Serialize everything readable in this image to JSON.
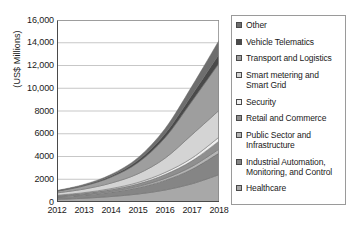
{
  "chart_data": {
    "type": "area",
    "stacked": true,
    "title": "",
    "xlabel": "",
    "ylabel": "(US$ Millions)",
    "x": [
      2012,
      2013,
      2014,
      2015,
      2016,
      2017,
      2018
    ],
    "xtick_labels": [
      "2012",
      "2013",
      "2014",
      "2015",
      "2016",
      "2017",
      "2018"
    ],
    "ytick_labels": [
      "16,000",
      "14,000",
      "12,000",
      "10,000",
      "8000",
      "6000",
      "4000",
      "2000",
      "0"
    ],
    "ytick_values": [
      16000,
      14000,
      12000,
      10000,
      8000,
      6000,
      4000,
      2000,
      0
    ],
    "ylim": [
      0,
      16000
    ],
    "grid": "horizontal",
    "legend_position": "right",
    "stack_order_bottom_to_top": [
      "Healthcare",
      "Industrial Automation, Monitoring, and Control",
      "Public Sector and Infrastructure",
      "Retail and Commerce",
      "Security",
      "Smart metering and Smart Grid",
      "Transport and Logistics",
      "Vehicle Telematics",
      "Other"
    ],
    "series": [
      {
        "name": "Healthcare",
        "color": "#a8a8a8",
        "values": [
          230,
          330,
          480,
          700,
          1050,
          1600,
          2400
        ]
      },
      {
        "name": "Industrial Automation, Monitoring, and Control",
        "color": "#858585",
        "values": [
          200,
          270,
          380,
          560,
          850,
          1280,
          1900
        ]
      },
      {
        "name": "Public Sector and Infrastructure",
        "color": "#b5b5b5",
        "values": [
          40,
          55,
          80,
          115,
          175,
          250,
          350
        ]
      },
      {
        "name": "Retail and Commerce",
        "color": "#8f8f8f",
        "values": [
          80,
          110,
          155,
          225,
          340,
          490,
          700
        ]
      },
      {
        "name": "Security",
        "color": "#efefef",
        "values": [
          45,
          60,
          85,
          120,
          180,
          250,
          350
        ]
      },
      {
        "name": "Smart metering and Smart Grid",
        "color": "#d4d4d4",
        "values": [
          200,
          310,
          480,
          760,
          1250,
          2050,
          2350
        ]
      },
      {
        "name": "Transport and Logistics",
        "color": "#9e9e9e",
        "values": [
          150,
          280,
          520,
          980,
          1800,
          2950,
          4150
        ]
      },
      {
        "name": "Vehicle Telematics",
        "color": "#4a4a4a",
        "values": [
          30,
          60,
          110,
          200,
          360,
          560,
          800
        ]
      },
      {
        "name": "Other",
        "color": "#6e6e6e",
        "values": [
          35,
          70,
          130,
          240,
          440,
          760,
          1200
        ]
      }
    ],
    "totals": [
      1010,
      1545,
      2420,
      3900,
      6445,
      10190,
      14200
    ]
  },
  "legend": {
    "items": [
      {
        "label": "Other",
        "color": "#6e6e6e"
      },
      {
        "label": "Vehicle Telematics",
        "color": "#4a4a4a"
      },
      {
        "label": "Transport and Logistics",
        "color": "#9e9e9e"
      },
      {
        "label": "Smart metering and Smart Grid",
        "color": "#d4d4d4"
      },
      {
        "label": "Security",
        "color": "#efefef"
      },
      {
        "label": "Retail and Commerce",
        "color": "#8f8f8f"
      },
      {
        "label": "Public Sector and Infrastructure",
        "color": "#b5b5b5"
      },
      {
        "label": "Industrial Automation, Monitoring, and Control",
        "color": "#858585"
      },
      {
        "label": "Healthcare",
        "color": "#a8a8a8"
      }
    ]
  },
  "colors": {
    "axis": "#4a4a4a",
    "gridline": "#b9b9b9",
    "plot_border": "#8c8c8c",
    "legend_border": "#9a9a9a",
    "text": "#1a1a1a",
    "background": "#ffffff"
  }
}
